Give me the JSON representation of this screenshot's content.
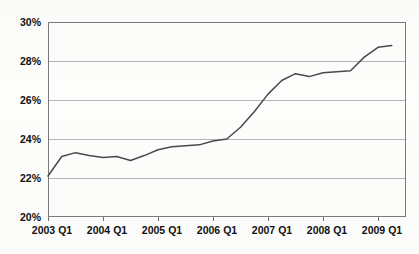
{
  "chart_data": {
    "type": "line",
    "title": "",
    "subtitle": "",
    "xlabel": "",
    "ylabel": "",
    "ylim": [
      20,
      30
    ],
    "ytick_values": [
      20,
      22,
      24,
      26,
      28,
      30
    ],
    "ytick_labels": [
      "20%",
      "22%",
      "24%",
      "26%",
      "28%",
      "30%"
    ],
    "xtick_labels": [
      "2003 Q1",
      "2004 Q1",
      "2005 Q1",
      "2006 Q1",
      "2007 Q1",
      "2008 Q1",
      "2009 Q1"
    ],
    "xtick_quarter_index": [
      0,
      4,
      8,
      12,
      16,
      20,
      24
    ],
    "grid": true,
    "legend": "none",
    "x_categories": [
      "2003 Q1",
      "2003 Q2",
      "2003 Q3",
      "2003 Q4",
      "2004 Q1",
      "2004 Q2",
      "2004 Q3",
      "2004 Q4",
      "2005 Q1",
      "2005 Q2",
      "2005 Q3",
      "2005 Q4",
      "2006 Q1",
      "2006 Q2",
      "2006 Q3",
      "2006 Q4",
      "2007 Q1",
      "2007 Q2",
      "2007 Q3",
      "2007 Q4",
      "2008 Q1",
      "2008 Q2",
      "2008 Q3",
      "2008 Q4",
      "2009 Q1",
      "2009 Q2"
    ],
    "series": [
      {
        "name": "Percentage",
        "color": "#4a4a4a",
        "values": [
          22.1,
          23.1,
          23.3,
          23.15,
          23.05,
          23.1,
          22.9,
          23.15,
          23.45,
          23.6,
          23.65,
          23.7,
          23.9,
          24.0,
          24.6,
          25.4,
          26.3,
          27.0,
          27.35,
          27.2,
          27.4,
          27.45,
          27.5,
          28.2,
          28.7,
          28.8
        ]
      }
    ],
    "line_color": "#4a4a4a",
    "axis_color": "#7a7a7a",
    "gridline_color": "#b4b4b4",
    "background_color": "#fdfdfd",
    "text_color": "#111111"
  }
}
